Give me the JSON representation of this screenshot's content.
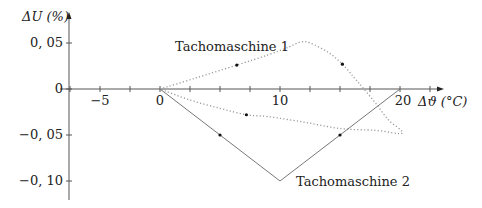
{
  "chart_data": {
    "type": "line",
    "title": "",
    "xlabel": "Δϑ (°C)",
    "ylabel": "ΔU (%)",
    "xlim": [
      -7.5,
      23.5
    ],
    "ylim": [
      -0.12,
      0.083
    ],
    "x_ticks": [
      -7.5,
      -5,
      -2.5,
      0,
      2.5,
      5,
      7.5,
      10,
      12.5,
      15,
      17.5,
      20,
      22.5
    ],
    "x_tick_labels": [
      {
        "value": -5,
        "label": "−5"
      },
      {
        "value": 0,
        "label": "0"
      },
      {
        "value": 10,
        "label": "10"
      },
      {
        "value": 20,
        "label": "20"
      }
    ],
    "y_ticks": [
      0.05,
      0,
      -0.05,
      -0.1
    ],
    "y_tick_labels": [
      {
        "value": 0.05,
        "label": "0, 05"
      },
      {
        "value": 0,
        "label": "0"
      },
      {
        "value": -0.05,
        "label": "−0, 05"
      },
      {
        "value": -0.1,
        "label": "−0, 10"
      }
    ],
    "grid": false,
    "legend": "none (inline annotations)",
    "series": [
      {
        "name": "Tachomaschine 1",
        "style": "dotted",
        "color": "#9a9a9a",
        "points": [
          [
            0,
            0
          ],
          [
            3,
            0.012
          ],
          [
            6.4,
            0.026
          ],
          [
            9,
            0.037
          ],
          [
            10.8,
            0.046
          ],
          [
            11.7,
            0.051
          ],
          [
            12.5,
            0.05
          ],
          [
            14,
            0.04
          ],
          [
            15.2,
            0.027
          ],
          [
            16.2,
            0.012
          ],
          [
            17,
            0
          ],
          [
            18,
            -0.016
          ],
          [
            19,
            -0.033
          ],
          [
            20.2,
            -0.048
          ],
          [
            18,
            -0.045
          ],
          [
            15,
            -0.043
          ],
          [
            12,
            -0.036
          ],
          [
            9,
            -0.03
          ],
          [
            7.2,
            -0.028
          ],
          [
            5,
            -0.021
          ],
          [
            2.5,
            -0.012
          ],
          [
            0,
            0
          ]
        ],
        "arrows": [
          [
            6.4,
            0.026
          ],
          [
            15.2,
            0.027
          ],
          [
            7.2,
            -0.028
          ]
        ]
      },
      {
        "name": "Tachomaschine 2",
        "style": "solid",
        "color": "#777777",
        "points": [
          [
            0,
            0
          ],
          [
            10,
            -0.1
          ],
          [
            20,
            0
          ]
        ],
        "arrows": [
          [
            5,
            -0.05
          ],
          [
            15,
            -0.05
          ]
        ]
      }
    ],
    "annotations": [
      {
        "text": "Tachomaschine 1",
        "x": 6,
        "y": 0.04
      },
      {
        "text": "Tachomaschine 2",
        "x": 11.2,
        "y": -0.108
      }
    ]
  },
  "labels": {
    "y_axis": "ΔU (%)",
    "x_axis": "Δϑ (°C)",
    "series1": "Tachomaschine 1",
    "series2": "Tachomaschine 2",
    "tick_x_m5": "−5",
    "tick_x_0": "0",
    "tick_x_10": "10",
    "tick_x_20": "20",
    "tick_y_005": "0, 05",
    "tick_y_0": "0",
    "tick_y_m005": "−0, 05",
    "tick_y_m010": "−0, 10"
  }
}
